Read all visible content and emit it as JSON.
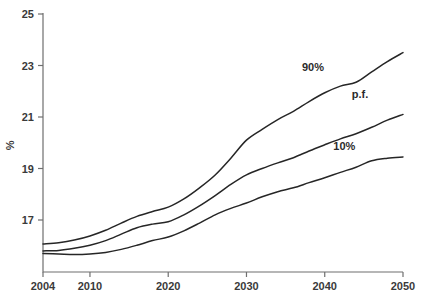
{
  "chart_data": {
    "type": "line",
    "title": "",
    "subtitle": "",
    "xlabel": "",
    "ylabel": "%",
    "xlim": [
      2004,
      2050
    ],
    "ylim": [
      15.2,
      25
    ],
    "grid": false,
    "legend_position": "inline-annotations",
    "x_ticks": [
      "2004",
      "2010",
      "2020",
      "2030",
      "2040",
      "2050"
    ],
    "x_tick_values": [
      2004,
      2010,
      2020,
      2030,
      2040,
      2050
    ],
    "y_ticks": [
      "17",
      "19",
      "21",
      "23",
      "25"
    ],
    "y_tick_values": [
      17,
      19,
      21,
      23,
      25
    ],
    "x": [
      2004,
      2006,
      2008,
      2010,
      2012,
      2014,
      2016,
      2018,
      2020,
      2022,
      2024,
      2026,
      2028,
      2030,
      2032,
      2034,
      2036,
      2038,
      2040,
      2042,
      2044,
      2046,
      2048,
      2050
    ],
    "series": [
      {
        "name": "90%",
        "label": "90%",
        "color": "#262626",
        "label_x": 2038.5,
        "label_y": 22.8,
        "values": [
          16.07,
          16.12,
          16.22,
          16.38,
          16.6,
          16.88,
          17.14,
          17.33,
          17.5,
          17.82,
          18.25,
          18.75,
          19.4,
          20.1,
          20.52,
          20.9,
          21.22,
          21.6,
          21.94,
          22.2,
          22.35,
          22.75,
          23.15,
          23.5
        ]
      },
      {
        "name": "p.f.",
        "label": "p.f.",
        "color": "#262626",
        "label_x": 2044.5,
        "label_y": 21.75,
        "values": [
          15.8,
          15.82,
          15.9,
          16.02,
          16.2,
          16.45,
          16.7,
          16.84,
          16.93,
          17.2,
          17.55,
          17.95,
          18.38,
          18.75,
          19.0,
          19.22,
          19.42,
          19.68,
          19.92,
          20.15,
          20.35,
          20.6,
          20.88,
          21.1
        ]
      },
      {
        "name": "10%",
        "label": "10%",
        "color": "#262626",
        "label_x": 2042.5,
        "label_y": 19.7,
        "values": [
          15.7,
          15.68,
          15.66,
          15.68,
          15.74,
          15.86,
          16.02,
          16.2,
          16.34,
          16.58,
          16.88,
          17.2,
          17.45,
          17.66,
          17.9,
          18.1,
          18.25,
          18.45,
          18.64,
          18.85,
          19.05,
          19.3,
          19.4,
          19.45
        ]
      }
    ]
  }
}
